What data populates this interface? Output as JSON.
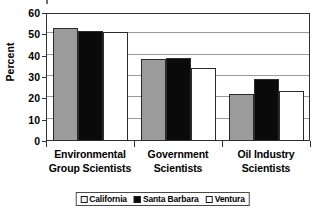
{
  "chart_data": {
    "type": "bar",
    "title": "",
    "xlabel": "",
    "ylabel": "Percent",
    "ylim": [
      0,
      60
    ],
    "yticks": [
      0,
      10,
      20,
      30,
      40,
      50,
      60
    ],
    "grid": true,
    "legend_position": "bottom",
    "categories": [
      "Environmental Group Scientists",
      "Government Scientists",
      "Oil Industry Scientists"
    ],
    "category_lines": [
      [
        "Environmental",
        "Group Scientists"
      ],
      [
        "Government",
        "Scientists"
      ],
      [
        "Oil Industry",
        "Scientists"
      ]
    ],
    "series": [
      {
        "name": "California",
        "color": "#9b9b9b",
        "values": [
          53,
          38.5,
          22
        ]
      },
      {
        "name": "Santa Barbara",
        "color": "#0a0a0a",
        "values": [
          51.5,
          39,
          29
        ]
      },
      {
        "name": "Ventura",
        "color": "#ffffff",
        "values": [
          51,
          34,
          23.5
        ]
      }
    ]
  },
  "axis": {
    "y_title": "Percent",
    "tick_labels": [
      "60",
      "50",
      "40",
      "30",
      "20",
      "10",
      "0"
    ]
  },
  "legend": {
    "items": [
      {
        "label": "California"
      },
      {
        "label": "Santa Barbara"
      },
      {
        "label": "Ventura"
      }
    ]
  }
}
